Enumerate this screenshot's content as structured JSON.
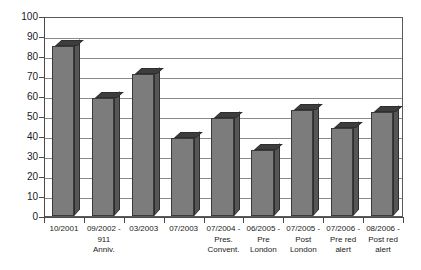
{
  "chart_data": {
    "type": "bar",
    "title": "",
    "xlabel": "",
    "ylabel": "",
    "ylim": [
      0,
      100
    ],
    "ytick_step": 10,
    "grid": true,
    "legend": "none",
    "bar_style": "3d-gray",
    "bar_color": "#7c7c7c",
    "bar_top_color": "#3d3d3d",
    "bar_side_color": "#555555",
    "gridline_color": "#8a8a8a",
    "axis_color": "#4a4a4a",
    "background_color": "#ffffff",
    "categories": [
      "10/2001",
      "09/2002 - 911 Anniv.",
      "03/2003",
      "07/2003",
      "07/2004 - Pres. Convent.",
      "06/2005 - Pre London",
      "07/2005 - Post London",
      "07/2006 - Pre red alert",
      "08/2006 - Post red alert"
    ],
    "category_lines": [
      [
        "10/2001"
      ],
      [
        "09/2002 -",
        "911",
        "Anniv."
      ],
      [
        "03/2003"
      ],
      [
        "07/2003"
      ],
      [
        "07/2004 -",
        "Pres.",
        "Convent."
      ],
      [
        "06/2005 -",
        "Pre",
        "London"
      ],
      [
        "07/2005 -",
        "Post",
        "London"
      ],
      [
        "07/2006 -",
        "Pre red",
        "alert"
      ],
      [
        "08/2006 -",
        "Post red",
        "alert"
      ]
    ],
    "values": [
      85,
      59,
      71,
      39,
      49,
      33,
      53,
      44,
      52
    ],
    "ytick_labels": [
      "0",
      "10",
      "20",
      "30",
      "40",
      "50",
      "60",
      "70",
      "80",
      "90",
      "100"
    ]
  }
}
